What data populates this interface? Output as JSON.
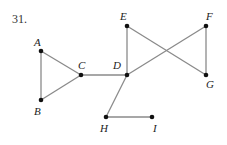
{
  "problem_number": "31.",
  "colors": {
    "edge": "#8a8a8a",
    "node": "#111111",
    "label": "#222222"
  },
  "nodes": [
    {
      "id": "A",
      "label": "A",
      "x": 41,
      "y": 51,
      "lx": 34,
      "ly": 46
    },
    {
      "id": "B",
      "label": "B",
      "x": 41,
      "y": 100,
      "lx": 34,
      "ly": 115
    },
    {
      "id": "C",
      "label": "C",
      "x": 81,
      "y": 75,
      "lx": 78,
      "ly": 69
    },
    {
      "id": "D",
      "label": "D",
      "x": 127,
      "y": 75,
      "lx": 113,
      "ly": 69
    },
    {
      "id": "E",
      "label": "E",
      "x": 127,
      "y": 26,
      "lx": 120,
      "ly": 20
    },
    {
      "id": "F",
      "label": "F",
      "x": 206,
      "y": 26,
      "lx": 206,
      "ly": 20
    },
    {
      "id": "G",
      "label": "G",
      "x": 206,
      "y": 75,
      "lx": 206,
      "ly": 88
    },
    {
      "id": "H",
      "label": "H",
      "x": 106,
      "y": 117,
      "lx": 100,
      "ly": 132
    },
    {
      "id": "I",
      "label": "I",
      "x": 152,
      "y": 117,
      "lx": 153,
      "ly": 132
    }
  ],
  "edges": [
    [
      "A",
      "B"
    ],
    [
      "A",
      "C"
    ],
    [
      "B",
      "C"
    ],
    [
      "C",
      "D"
    ],
    [
      "D",
      "E"
    ],
    [
      "E",
      "G"
    ],
    [
      "D",
      "F"
    ],
    [
      "F",
      "G"
    ],
    [
      "D",
      "H"
    ],
    [
      "H",
      "I"
    ]
  ]
}
